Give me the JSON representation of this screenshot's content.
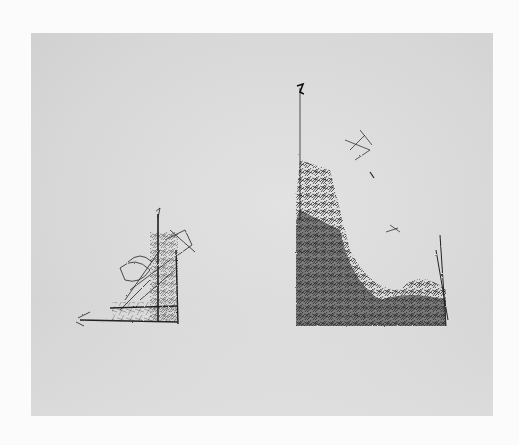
{
  "image": {
    "description": "Photograph of a work on paper: two abstract scribbled pen drawings on a gray sheet, each resembling an L-shaped dense mass of lines.",
    "colors": {
      "background": "#fbfbfb",
      "paper": "#dcdcdc",
      "ink": "#1e1e1e"
    },
    "drawings": [
      {
        "name": "small-left-drawing",
        "bbox": [
          75,
          205,
          195,
          325
        ]
      },
      {
        "name": "large-right-drawing",
        "bbox": [
          292,
          80,
          450,
          328
        ]
      }
    ]
  }
}
